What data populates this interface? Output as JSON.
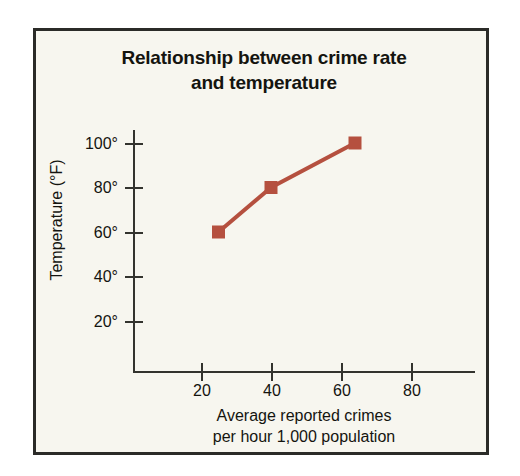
{
  "chart_data": {
    "type": "line",
    "title": "Relationship between crime rate and temperature",
    "title_lines": [
      "Relationship between crime rate",
      "and temperature"
    ],
    "xlabel": "Average reported crimes per hour 1,000 population",
    "xlabel_lines": [
      "Average reported crimes",
      "per hour 1,000 population"
    ],
    "ylabel": "Temperature (°F)",
    "x": [
      25,
      40,
      64
    ],
    "values": [
      60,
      80,
      100
    ],
    "series": [
      {
        "name": "crime rate vs temperature",
        "color": "#b5503f",
        "marker": "square",
        "points": [
          {
            "x": 25,
            "y": 60
          },
          {
            "x": 40,
            "y": 80
          },
          {
            "x": 64,
            "y": 100
          }
        ]
      }
    ],
    "xticks": [
      20,
      40,
      60,
      80
    ],
    "xtick_labels": [
      "20",
      "40",
      "60",
      "80"
    ],
    "yticks": [
      20,
      40,
      60,
      80,
      100
    ],
    "ytick_labels": [
      "20°",
      "40°",
      "60°",
      "80°",
      "100°"
    ],
    "xlim": [
      0,
      98
    ],
    "ylim": [
      0,
      110
    ],
    "grid": false,
    "legend": false
  },
  "style": {
    "background": "#f7f6ef",
    "page_background": "#ffffff",
    "frame_color": "#2b2b28",
    "axis_color": "#33332e",
    "text_color": "#14140f",
    "series_color": "#b5503f"
  }
}
